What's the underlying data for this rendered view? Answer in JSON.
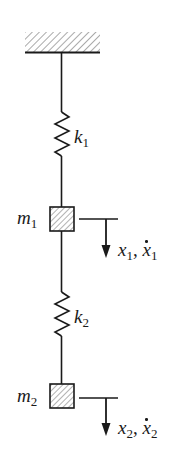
{
  "diagram": {
    "type": "two-degree-of-freedom spring-mass system",
    "colors": {
      "stroke": "#1a1a1a",
      "hatch": "#555555",
      "background": "#ffffff"
    },
    "support": {
      "label": "fixed-ceiling"
    },
    "springs": [
      {
        "id": "k1",
        "symbol": "k",
        "subscript": "1"
      },
      {
        "id": "k2",
        "symbol": "k",
        "subscript": "2"
      }
    ],
    "masses": [
      {
        "id": "m1",
        "symbol": "m",
        "subscript": "1"
      },
      {
        "id": "m2",
        "symbol": "m",
        "subscript": "2"
      }
    ],
    "displacements": [
      {
        "id": "x1",
        "pos": "x",
        "pos_sub": "1",
        "sep": ", ",
        "vel": "x",
        "vel_sub": "1",
        "direction": "down"
      },
      {
        "id": "x2",
        "pos": "x",
        "pos_sub": "2",
        "sep": ", ",
        "vel": "x",
        "vel_sub": "2",
        "direction": "down"
      }
    ]
  }
}
